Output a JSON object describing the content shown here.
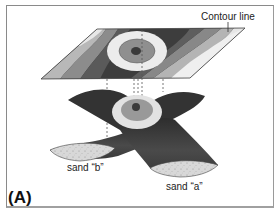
{
  "figure": {
    "panel_label": "(A)",
    "labels": {
      "contour_line": "Contour line",
      "sand_b": "sand “b”",
      "sand_a": "sand “a”"
    },
    "elements": {
      "top_plane": "contour map (map view of structure)",
      "bottom_body": "saddle-shaped intersecting sand bodies",
      "projection_lines": "dashed vertical projection lines"
    },
    "colors": {
      "frame": "#8a8a8a",
      "darkest": "#3a3a3a",
      "dark": "#555555",
      "mid": "#888888",
      "light": "#b8b8b8",
      "lightest": "#e8e8e8",
      "sand": "#d6d6d6"
    }
  }
}
